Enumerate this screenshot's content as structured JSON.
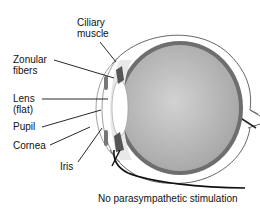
{
  "diagram": {
    "labels": {
      "ciliary_muscle": "Ciliary muscle",
      "ciliary_line1": "Ciliary",
      "ciliary_line2": "muscle",
      "zonular_line1": "Zonular",
      "zonular_line2": "fibers",
      "lens_line1": "Lens",
      "lens_line2": "(flat)",
      "pupil": "Pupil",
      "cornea": "Cornea",
      "iris": "Iris",
      "caption": "No parasympathetic stimulation"
    },
    "colors": {
      "vitreous": "#b8b8b8",
      "choroid": "#6e6e6e",
      "outline": "#555555",
      "lens": "#ffffff"
    }
  }
}
